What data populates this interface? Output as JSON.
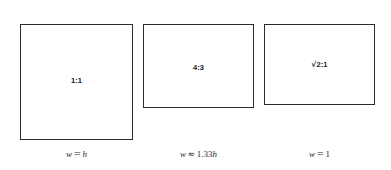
{
  "figure": {
    "background_color": "#ffffff",
    "stroke_color": "#2b2b2b",
    "text_color": "#1a1a1a"
  },
  "boxes": [
    {
      "name": "square-1-1",
      "ratio_label": "1:1",
      "caption_var": "w",
      "caption_op": "=",
      "caption_value": "h",
      "caption_full": "w = h"
    },
    {
      "name": "rectangle-4-3",
      "ratio_label": "4:3",
      "caption_var": "w",
      "caption_op": "≈",
      "caption_value": "1.33",
      "caption_unit": "h",
      "caption_full": "w ≈ 1.33h"
    },
    {
      "name": "rectangle-sqrt2-1",
      "ratio_radical": "√",
      "ratio_radicand": "2",
      "ratio_suffix": ":1",
      "ratio_label": "√2:1",
      "caption_var": "w",
      "caption_op": "=",
      "caption_value": "1",
      "caption_full": "w = 1"
    }
  ]
}
